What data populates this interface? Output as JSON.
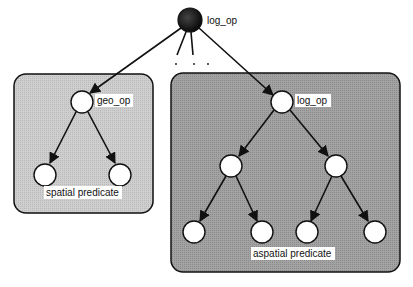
{
  "diagram": {
    "root": {
      "label": "log_op",
      "x": 190,
      "y": 20,
      "r": 12,
      "fill": "#1a1a1a"
    },
    "ellipsis": [
      "·",
      "·",
      "·"
    ],
    "left_box": {
      "x": 14,
      "y": 74,
      "w": 139,
      "h": 139,
      "rx": 12,
      "fill": "#c9c9c9",
      "op_node": {
        "label": "geo_op",
        "x": 82,
        "y": 102
      },
      "leaves": [
        {
          "x": 45,
          "y": 175
        },
        {
          "x": 120,
          "y": 175
        }
      ],
      "caption": "spatial predicate"
    },
    "right_box": {
      "x": 171,
      "y": 73,
      "w": 229,
      "h": 199,
      "rx": 12,
      "fill": "#9c9c9c",
      "op_node": {
        "label": "log_op",
        "x": 282,
        "y": 102
      },
      "mid_nodes": [
        {
          "x": 231,
          "y": 166
        },
        {
          "x": 336,
          "y": 166
        }
      ],
      "leaves": [
        {
          "x": 194,
          "y": 232
        },
        {
          "x": 262,
          "y": 232
        },
        {
          "x": 307,
          "y": 232
        },
        {
          "x": 375,
          "y": 232
        }
      ],
      "caption": "aspatial predicate"
    },
    "node_radius": 11,
    "node_fill": "#ffffff",
    "stroke": "#111111"
  }
}
